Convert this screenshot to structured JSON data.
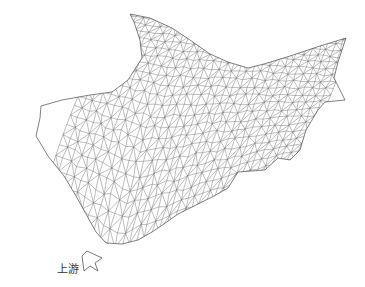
{
  "figure": {
    "type": "triangulated terrain mesh (wireframe)",
    "background": "#ffffff",
    "line_color": "#6b6b6b"
  },
  "labels": {
    "upstream": "上游"
  },
  "arrow": {
    "icon": "outline-arrow-up-right-icon",
    "points": [
      [
        87,
        251
      ],
      [
        102,
        258
      ],
      [
        95,
        263
      ],
      [
        98,
        271
      ],
      [
        90,
        266
      ],
      [
        84,
        271
      ],
      [
        82,
        256
      ]
    ]
  },
  "mesh": {
    "outline": [
      [
        41,
        106
      ],
      [
        62,
        100
      ],
      [
        90,
        95
      ],
      [
        112,
        92
      ],
      [
        128,
        80
      ],
      [
        142,
        58
      ],
      [
        140,
        40
      ],
      [
        134,
        22
      ],
      [
        130,
        14
      ],
      [
        150,
        18
      ],
      [
        172,
        28
      ],
      [
        190,
        40
      ],
      [
        210,
        54
      ],
      [
        228,
        62
      ],
      [
        248,
        68
      ],
      [
        264,
        64
      ],
      [
        290,
        56
      ],
      [
        320,
        46
      ],
      [
        346,
        38
      ],
      [
        338,
        62
      ],
      [
        334,
        78
      ],
      [
        345,
        100
      ],
      [
        325,
        102
      ],
      [
        318,
        110
      ],
      [
        306,
        130
      ],
      [
        300,
        150
      ],
      [
        290,
        160
      ],
      [
        278,
        158
      ],
      [
        265,
        170
      ],
      [
        238,
        172
      ],
      [
        228,
        188
      ],
      [
        214,
        196
      ],
      [
        198,
        204
      ],
      [
        178,
        214
      ],
      [
        164,
        224
      ],
      [
        152,
        232
      ],
      [
        138,
        240
      ],
      [
        122,
        244
      ],
      [
        106,
        243
      ],
      [
        96,
        232
      ],
      [
        86,
        214
      ],
      [
        76,
        196
      ],
      [
        64,
        176
      ],
      [
        48,
        156
      ],
      [
        36,
        136
      ],
      [
        40,
        118
      ]
    ],
    "grid": {
      "rows": 22,
      "cols": 34,
      "seed": 7,
      "jitter": 0.32
    }
  }
}
